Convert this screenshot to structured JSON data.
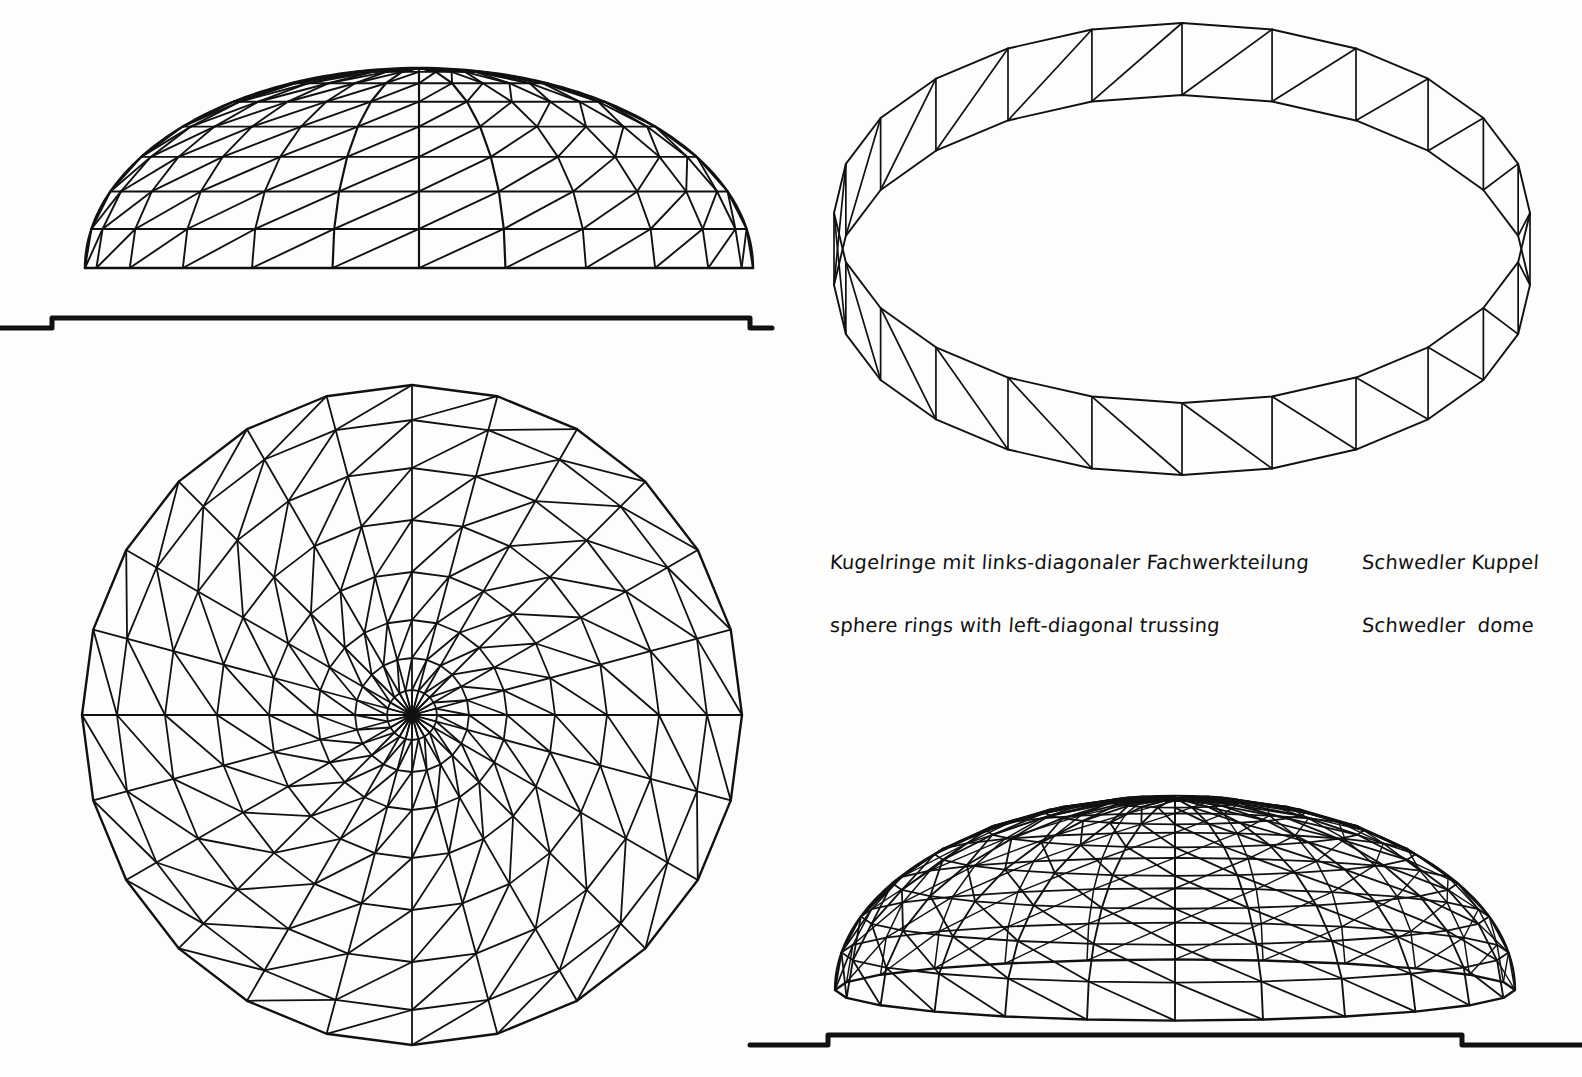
{
  "sheet": {
    "title": "Schwedler Kuppel / Schwedler dome",
    "background_color": "#fdfdfc",
    "ink_color": "#111111",
    "width": 1582,
    "height": 1077
  },
  "captions": {
    "left": {
      "german": "Kugelringe mit links-diagonaler Fachwerkteilung",
      "english": "sphere rings with left-diagonal trussing"
    },
    "right": {
      "german": "Schwedler Kuppel",
      "english": "Schwedler  dome"
    }
  },
  "chart_data": {
    "type": "diagram",
    "title": "Schwedler Kuppel",
    "segments": 24,
    "ring_levels": 8,
    "views": [
      {
        "id": "elevation-top-left",
        "label": "elevation",
        "center_x": 419,
        "base_y": 268,
        "radius_x": 334,
        "radius_y": 200,
        "ground_y": 318,
        "ground_x0": 0,
        "ground_x1": 772,
        "ground_step": 10,
        "ground_thickness": 5
      },
      {
        "id": "plan-bottom-left",
        "label": "plan",
        "center_x": 412,
        "center_y": 715,
        "radius": 330,
        "ring_radii": [
          25,
          57,
          95,
          143,
          195,
          247,
          295,
          330
        ]
      },
      {
        "id": "ring-band-top-right",
        "label": "base ring band, axonometric",
        "center_x": 1182,
        "center_y": 285,
        "radius_x": 348,
        "radius_y": 190,
        "band_height": 72
      },
      {
        "id": "perspective-bottom-right",
        "label": "dome, axonometric",
        "center_x": 1175,
        "base_y": 990,
        "radius_x": 340,
        "radius_y": 180,
        "height": 192,
        "ground_y": 1035,
        "ground_x0": 750,
        "ground_x1": 1582,
        "ground_step": 10,
        "ground_thickness": 5
      }
    ],
    "members": [
      "meridional ribs",
      "horizontal rings",
      "left-diagonal bracing"
    ]
  }
}
